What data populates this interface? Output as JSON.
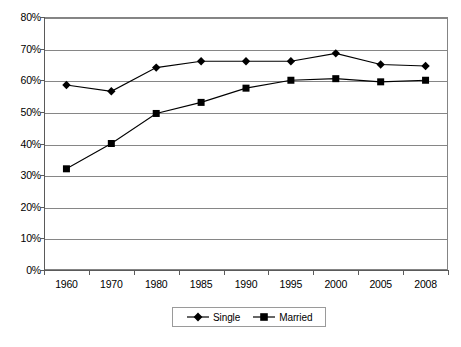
{
  "chart_data": {
    "type": "line",
    "title": "",
    "subtitle": "",
    "xlabel": "",
    "ylabel": "",
    "categories": [
      "1960",
      "1970",
      "1980",
      "1985",
      "1990",
      "1995",
      "2000",
      "2005",
      "2008"
    ],
    "series": [
      {
        "name": "Single",
        "marker": "diamond",
        "color": "#000000",
        "values": [
          58.5,
          56.5,
          64.0,
          66.0,
          66.0,
          66.0,
          68.5,
          65.0,
          64.5
        ]
      },
      {
        "name": "Married",
        "marker": "square",
        "color": "#000000",
        "values": [
          32.0,
          40.0,
          49.5,
          53.0,
          57.5,
          60.0,
          60.5,
          59.5,
          60.0
        ]
      }
    ],
    "ylim": [
      0,
      80
    ],
    "ytick_step": 10,
    "ytick_labels": [
      "0%",
      "10%",
      "20%",
      "30%",
      "40%",
      "50%",
      "60%",
      "70%",
      "80%"
    ],
    "ytick_values": [
      0,
      10,
      20,
      30,
      40,
      50,
      60,
      70,
      80
    ],
    "grid": true,
    "grid_axis": "y",
    "legend_position": "bottom-center",
    "legend_entries": [
      "Single",
      "Married"
    ],
    "plot_border": true,
    "colors": {
      "series_line": "#000000",
      "gridline": "#868686",
      "axis": "#5a5a5a",
      "plot_border": "#848484",
      "background": "#ffffff",
      "text": "#000000",
      "legend_border": "#9a9a9a"
    }
  }
}
